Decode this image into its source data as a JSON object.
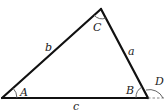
{
  "diagram": {
    "type": "triangle",
    "vertices": {
      "A": {
        "label": "A",
        "x": 2,
        "y": 98
      },
      "B": {
        "label": "B",
        "x": 148,
        "y": 98
      },
      "C": {
        "label": "C",
        "x": 101,
        "y": 9
      }
    },
    "sides": {
      "a": {
        "label": "a",
        "from": "B",
        "to": "C"
      },
      "b": {
        "label": "b",
        "from": "A",
        "to": "C"
      },
      "c": {
        "label": "c",
        "from": "A",
        "to": "B"
      }
    },
    "angles": {
      "A": "A",
      "B": "B",
      "C": "C",
      "D": "D"
    },
    "exterior_angle": {
      "label": "D",
      "at": "B",
      "extension": "dashed"
    },
    "colors": {
      "lines": "#111111",
      "arcs": "#555555",
      "text": "#222222"
    }
  }
}
